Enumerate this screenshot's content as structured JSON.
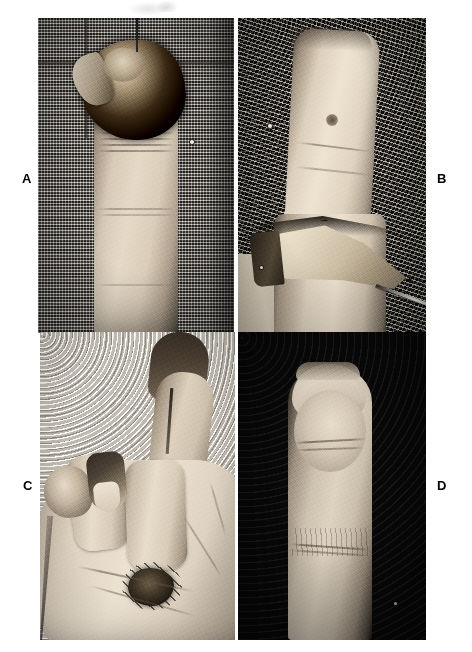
{
  "figure": {
    "type": "clinical-photograph-plate",
    "panel_count": 4,
    "background_color": "#ffffff",
    "label_color": "#000000",
    "panels": [
      {
        "id": "A",
        "label": "A",
        "label_position": "left-margin",
        "caption": "",
        "subject": "fingertip with avulsion wound and necrotic eschar at the tip, finger on textured cloth drape",
        "background_description": "coarse woven cloth drape, mid-gray",
        "x": 38,
        "y": 18,
        "width": 196,
        "height": 315
      },
      {
        "id": "B",
        "label": "B",
        "label_position": "right-margin",
        "caption": "",
        "subject": "lateral view of finger with triangular flap elevated and held by a needle/instrument",
        "background_description": "coarse woven cloth drape, dark gray stipple",
        "x": 238,
        "y": 18,
        "width": 188,
        "height": 315
      },
      {
        "id": "C",
        "label": "C",
        "label_position": "left-margin",
        "caption": "",
        "subject": "hand with flexed fingers, one digit raised showing dark distal tip and a sutured graft site",
        "background_description": "light stippled wall / pale surface",
        "x": 40,
        "y": 332,
        "width": 195,
        "height": 308
      },
      {
        "id": "D",
        "label": "D",
        "label_position": "right-margin",
        "caption": "",
        "subject": "healed fingertip after reconstruction, frontal view on black background",
        "background_description": "black backdrop",
        "x": 238,
        "y": 332,
        "width": 188,
        "height": 308
      }
    ],
    "labels": [
      {
        "text": "A",
        "x": 22,
        "y": 172
      },
      {
        "text": "B",
        "x": 437,
        "y": 172
      },
      {
        "text": "C",
        "x": 23,
        "y": 479
      },
      {
        "text": "D",
        "x": 437,
        "y": 479
      }
    ]
  }
}
